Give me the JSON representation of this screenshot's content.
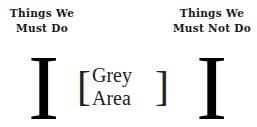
{
  "left_column": {
    "title_line1": "Things We",
    "title_line2": "Must Do",
    "symbol": "I"
  },
  "right_column": {
    "title_line1": "Things We",
    "title_line2": "Must Not Do",
    "symbol": "I"
  },
  "middle": {
    "open_bracket": "[",
    "label": "Grey Area",
    "close_bracket": "]"
  }
}
